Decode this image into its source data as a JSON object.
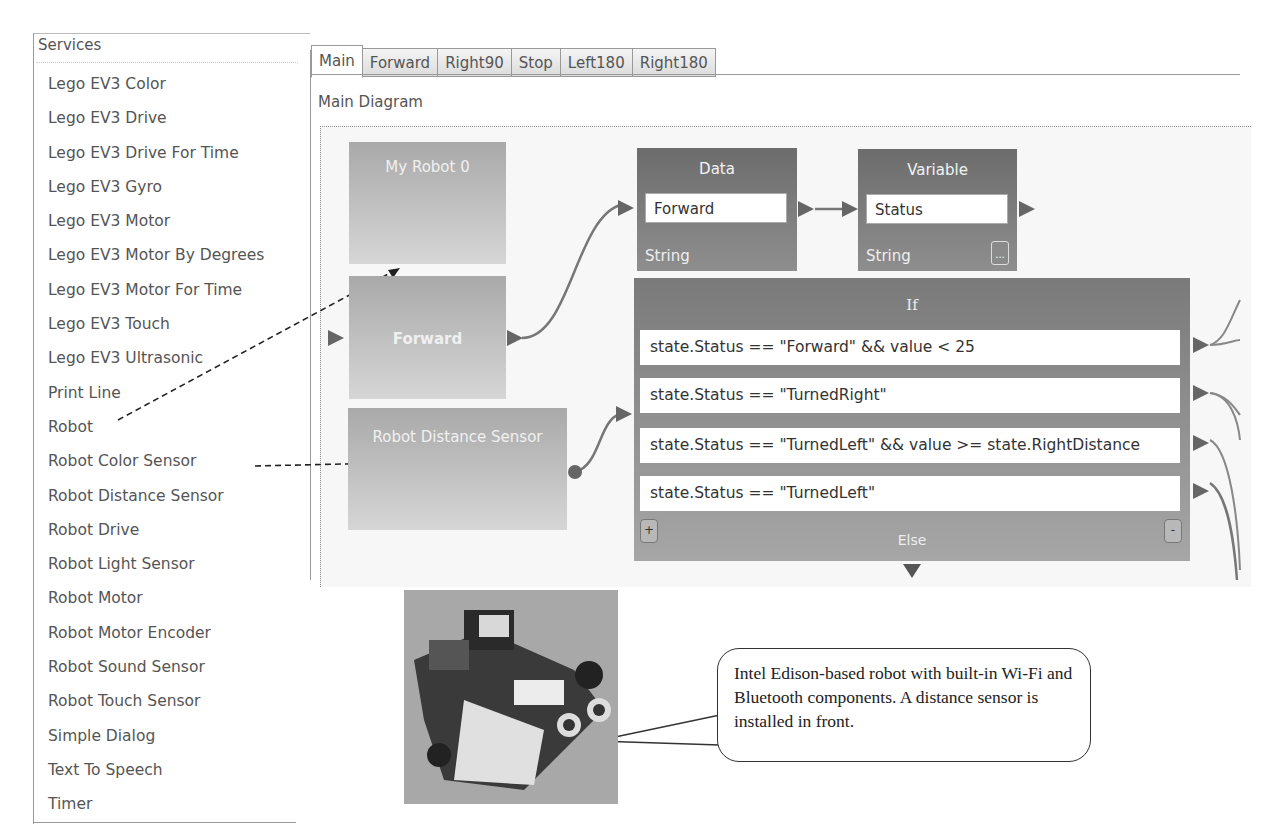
{
  "services_panel": {
    "header": "Services",
    "items": [
      "Lego EV3 Color",
      "Lego EV3 Drive",
      "Lego EV3 Drive For Time",
      "Lego EV3 Gyro",
      "Lego EV3 Motor",
      "Lego EV3 Motor By Degrees",
      "Lego EV3 Motor For Time",
      "Lego EV3 Touch",
      "Lego EV3 Ultrasonic",
      "Print Line",
      "Robot",
      "Robot Color Sensor",
      "Robot Distance Sensor",
      "Robot Drive",
      "Robot Light Sensor",
      "Robot Motor",
      "Robot Motor Encoder",
      "Robot Sound Sensor",
      "Robot Touch Sensor",
      "Simple Dialog",
      "Text To Speech",
      "Timer"
    ]
  },
  "tabs": [
    {
      "label": "Main",
      "active": true
    },
    {
      "label": "Forward"
    },
    {
      "label": "Right90"
    },
    {
      "label": "Stop"
    },
    {
      "label": "Left180"
    },
    {
      "label": "Right180"
    }
  ],
  "diagram": {
    "title": "Main Diagram",
    "blocks": {
      "my_robot": {
        "label": "My Robot 0"
      },
      "forward": {
        "label": "Forward"
      },
      "distance_sensor": {
        "label": "Robot Distance Sensor"
      },
      "data": {
        "title": "Data",
        "value": "Forward",
        "type": "String"
      },
      "variable": {
        "title": "Variable",
        "value": "Status",
        "type": "String",
        "ellipsis": "..."
      },
      "if": {
        "title": "If",
        "conditions": [
          "state.Status == \"Forward\" && value < 25",
          "state.Status == \"TurnedRight\"",
          "state.Status == \"TurnedLeft\" && value >= state.RightDistance",
          "state.Status == \"TurnedLeft\""
        ],
        "add_label": "+",
        "remove_label": "-",
        "else_label": "Else"
      }
    }
  },
  "callout": {
    "text": "Intel Edison-based robot with built-in Wi-Fi and Bluetooth components. A distance sensor is installed in front."
  },
  "colors": {
    "service_block": "#b8b8b8",
    "data_block": "#747474",
    "if_block": "#8a8a8a",
    "connector": "#666666"
  }
}
